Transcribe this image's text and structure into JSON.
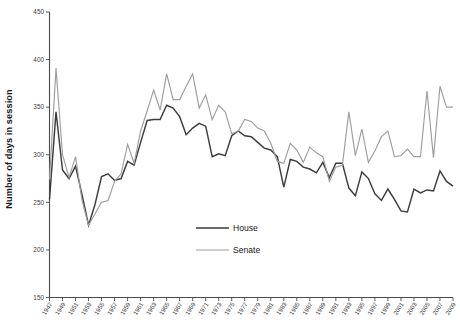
{
  "chart_data": {
    "type": "line",
    "title": "",
    "subtitle": "",
    "xlabel": "",
    "ylabel": "Number of days in session",
    "ylim": [
      150,
      450
    ],
    "yticks": [
      150,
      200,
      250,
      300,
      350,
      400,
      450
    ],
    "xlim": [
      1947,
      2009
    ],
    "xticks": [
      1947,
      1949,
      1951,
      1953,
      1955,
      1957,
      1959,
      1961,
      1963,
      1965,
      1967,
      1969,
      1971,
      1973,
      1975,
      1977,
      1979,
      1981,
      1983,
      1985,
      1987,
      1989,
      1991,
      1993,
      1995,
      1997,
      1999,
      2001,
      2003,
      2005,
      2007,
      2009
    ],
    "grid": false,
    "legend_position": "inside-center-lower",
    "x": [
      1947,
      1948,
      1949,
      1950,
      1951,
      1952,
      1953,
      1954,
      1955,
      1956,
      1957,
      1958,
      1959,
      1960,
      1961,
      1962,
      1963,
      1964,
      1965,
      1966,
      1967,
      1968,
      1969,
      1970,
      1971,
      1972,
      1973,
      1974,
      1975,
      1976,
      1977,
      1978,
      1979,
      1980,
      1981,
      1982,
      1983,
      1984,
      1985,
      1986,
      1987,
      1988,
      1989,
      1990,
      1991,
      1992,
      1993,
      1994,
      1995,
      1996,
      1997,
      1998,
      1999,
      2000,
      2001,
      2002,
      2003,
      2004,
      2005,
      2006,
      2007,
      2008,
      2009
    ],
    "series": [
      {
        "name": "House",
        "color": "#3d3d3d",
        "values": [
          253,
          345,
          284,
          275,
          288,
          258,
          226,
          248,
          277,
          280,
          273,
          275,
          293,
          289,
          313,
          336,
          337,
          337,
          352,
          349,
          340,
          321,
          328,
          333,
          330,
          298,
          301,
          299,
          320,
          325,
          320,
          319,
          313,
          307,
          305,
          298,
          266,
          295,
          293,
          287,
          285,
          281,
          292,
          276,
          291,
          291,
          265,
          257,
          282,
          275,
          259,
          252,
          264,
          253,
          241,
          240,
          264,
          260,
          263,
          262,
          283,
          272,
          267
        ]
      },
      {
        "name": "Senate",
        "color": "#9d9d9d",
        "values": [
          274,
          391,
          300,
          276,
          298,
          252,
          226,
          238,
          250,
          252,
          272,
          280,
          311,
          291,
          325,
          346,
          368,
          347,
          385,
          358,
          358,
          372,
          385,
          349,
          363,
          337,
          352,
          345,
          322,
          325,
          337,
          335,
          328,
          325,
          312,
          293,
          291,
          312,
          305,
          292,
          308,
          302,
          298,
          272,
          287,
          289,
          345,
          299,
          327,
          292,
          304,
          319,
          325,
          298,
          299,
          306,
          298,
          298,
          367,
          297,
          372,
          350,
          350
        ]
      }
    ],
    "legend": [
      {
        "label": "House",
        "color": "#3d3d3d",
        "width": 1.6
      },
      {
        "label": "Senate",
        "color": "#9d9d9d",
        "width": 1.2
      }
    ]
  }
}
